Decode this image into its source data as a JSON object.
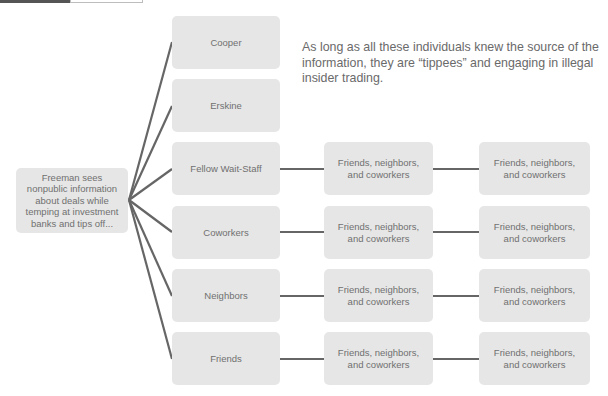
{
  "header": {
    "tab_active_color": "#555555",
    "tab_inactive_color": "#ffffff"
  },
  "source": {
    "label": "Freeman sees nonpublic information about deals while temping at investment banks and tips off..."
  },
  "note": {
    "text": "As long as all these individuals knew the source of the information, they are “tippees” and engaging in illegal insider trading."
  },
  "tippees": [
    {
      "label": "Cooper"
    },
    {
      "label": "Erskine"
    },
    {
      "label": "Fellow Wait-Staff"
    },
    {
      "label": "Coworkers"
    },
    {
      "label": "Neighbors"
    },
    {
      "label": "Friends"
    }
  ],
  "second_tier": [
    {
      "label": "Friends, neighbors, and coworkers"
    },
    {
      "label": "Friends, neighbors, and coworkers"
    },
    {
      "label": "Friends, neighbors, and coworkers"
    },
    {
      "label": "Friends, neighbors, and coworkers"
    }
  ],
  "third_tier": [
    {
      "label": "Friends, neighbors, and coworkers"
    },
    {
      "label": "Friends, neighbors, and coworkers"
    },
    {
      "label": "Friends, neighbors, and coworkers"
    },
    {
      "label": "Friends, neighbors, and coworkers"
    }
  ],
  "colors": {
    "node_fill": "#e6e6e6",
    "connector": "#666666",
    "text": "#707070"
  }
}
